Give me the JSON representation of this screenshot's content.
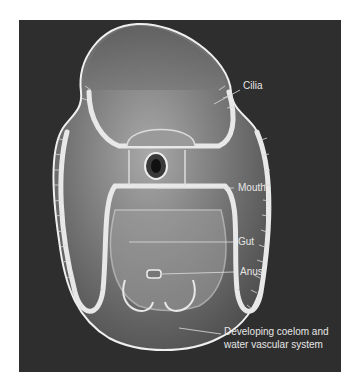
{
  "figure": {
    "type": "larva-anatomy-illustration",
    "colors": {
      "background": "#2e2e2e",
      "page": "#ffffff",
      "body": "#8a8a8a",
      "outline": "#f0f0f0",
      "label": "#e6e6e6"
    },
    "labels": [
      {
        "id": "cilia",
        "text": "Cilia"
      },
      {
        "id": "mouth",
        "text": "Mouth"
      },
      {
        "id": "gut",
        "text": "Gut"
      },
      {
        "id": "anus",
        "text": "Anus"
      },
      {
        "id": "coelom",
        "line1": "Developing coelom and",
        "line2": "water vascular system"
      }
    ]
  }
}
